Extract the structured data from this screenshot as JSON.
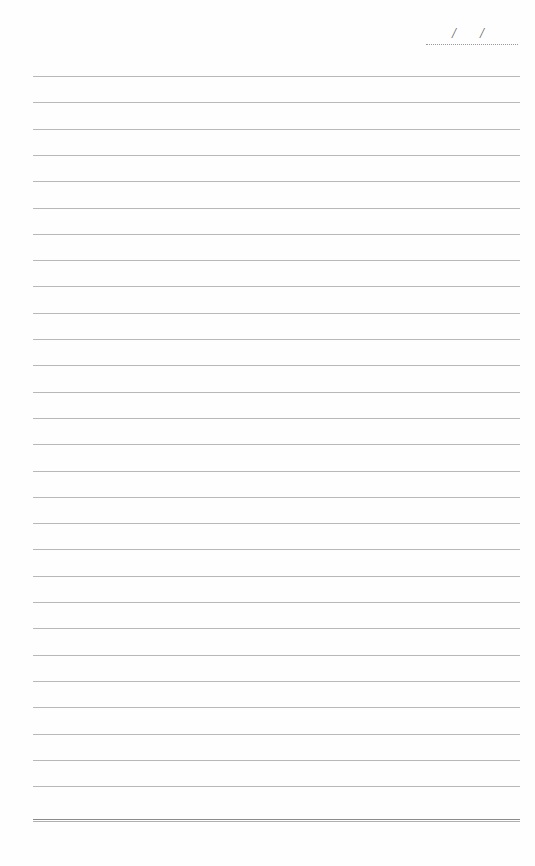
{
  "page": {
    "type": "lined-notepaper",
    "background": "#fefefe",
    "rule_color": "#b8b8b8",
    "rule_count": 28,
    "rule_start_y": 76,
    "rule_spacing": 26.3
  },
  "date_field": {
    "separator_1": "/",
    "separator_2": "/",
    "value": ""
  },
  "footer_rule": {
    "style": "double",
    "y": 819
  }
}
